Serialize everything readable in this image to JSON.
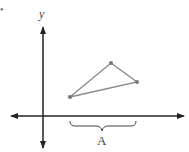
{
  "diagram": {
    "bullet": "•",
    "y_axis_label": "y",
    "brace_label": "A",
    "colors": {
      "axis": "#222222",
      "triangle": "#888888",
      "vertex": "#777777",
      "brace": "#444444"
    },
    "triangle_vertices": [
      [
        70,
        97
      ],
      [
        111,
        63
      ],
      [
        137,
        82
      ]
    ]
  }
}
